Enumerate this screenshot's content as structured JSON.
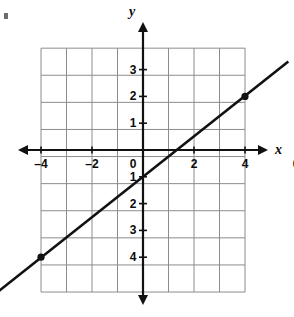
{
  "figure": {
    "width": 294,
    "height": 317,
    "background_color": "#ffffff"
  },
  "axes": {
    "x_axis_name": "x",
    "y_axis_name": "y",
    "origin_label": "0",
    "grid_color": "#8c8c8c",
    "axis_color": "#111111",
    "line_color": "#111111",
    "point_color": "#111111",
    "label_color": "#0b0b0b"
  },
  "x_tick_labels": [
    {
      "text": "–6",
      "value": -6
    },
    {
      "text": "–4",
      "value": -4
    },
    {
      "text": "–2",
      "value": -2
    },
    {
      "text": "2",
      "value": 2
    },
    {
      "text": "4",
      "value": 4
    },
    {
      "text": "6",
      "value": 6
    }
  ],
  "y_tick_labels": [
    {
      "text": "3",
      "value": 3
    },
    {
      "text": "2",
      "value": 2
    },
    {
      "text": "1",
      "value": 1
    },
    {
      "text": "1",
      "value": -1
    },
    {
      "text": "2",
      "value": -2
    },
    {
      "text": "3",
      "value": -3
    },
    {
      "text": "4",
      "value": -4
    }
  ],
  "chart_data": {
    "type": "line",
    "title": "",
    "xlabel": "x",
    "ylabel": "y",
    "xlim": [
      -8,
      8
    ],
    "ylim": [
      -5.3,
      3.8
    ],
    "grid": true,
    "legend_position": "none",
    "x_ticks": [
      -6,
      -4,
      -2,
      0,
      2,
      4,
      6
    ],
    "y_ticks": [
      3,
      2,
      1,
      -1,
      -2,
      -3,
      -4
    ],
    "grid_extent": {
      "x_min": -4,
      "x_max": 4,
      "y_min": -5.3,
      "y_max": 3.8,
      "columns": 8,
      "rows": 9
    },
    "series": [
      {
        "name": "line",
        "equation": "y = 0.75x - 1",
        "slope": 0.75,
        "intercept": -1,
        "x": [
          -5.7,
          5.7
        ],
        "y": [
          -5.3,
          3.3
        ]
      }
    ],
    "points": [
      {
        "x": 4,
        "y": 2,
        "marker": "filled-circle"
      },
      {
        "x": -4,
        "y": -4,
        "marker": "filled-circle"
      }
    ]
  }
}
